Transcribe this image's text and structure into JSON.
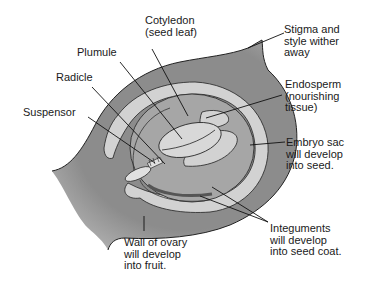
{
  "diagram": {
    "colors": {
      "ovary_wall": "#8c8c8c",
      "light_tissue": "#d2d2d2",
      "embryo_sac": "#a6a6a6",
      "outline": "#222222",
      "background": "#ffffff"
    },
    "labels": {
      "cotyledon": [
        "Cotyledon",
        "(seed leaf)"
      ],
      "plumule": [
        "Plumule"
      ],
      "radicle": [
        "Radicle"
      ],
      "suspensor": [
        "Suspensor"
      ],
      "stigma": [
        "Stigma and",
        "style wither",
        "away"
      ],
      "endosperm": [
        "Endosperm",
        "(nourishing",
        "tissue)"
      ],
      "embryo_sac": [
        "Embryo sac",
        "will develop",
        "into seed."
      ],
      "integuments": [
        "Integuments",
        "will develop",
        "into seed coat."
      ],
      "ovary_wall": [
        "Wall of ovary",
        "will develop",
        "into fruit."
      ]
    }
  }
}
